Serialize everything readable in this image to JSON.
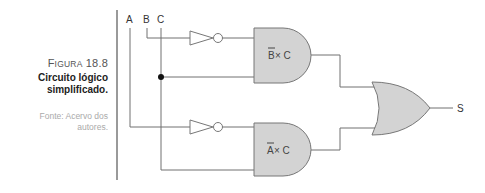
{
  "caption": {
    "figure_prefix": "F",
    "figure_prefix_rest": "IGURA",
    "figure_number": "18.8",
    "title_line1": "Circuito lógico",
    "title_line2": "simplificado.",
    "source_line1": "Fonte: Acervo dos",
    "source_line2": "autores."
  },
  "diagram": {
    "inputs": [
      "A",
      "B",
      "C"
    ],
    "gates": [
      {
        "type": "AND",
        "label_neg": "B",
        "label_rest": " × C"
      },
      {
        "type": "AND",
        "label_neg": "A",
        "label_rest": " × C"
      },
      {
        "type": "OR"
      }
    ],
    "output": "S"
  }
}
